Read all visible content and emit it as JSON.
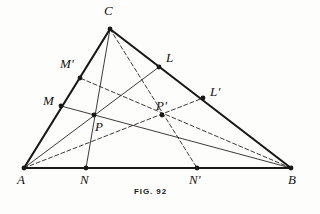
{
  "figure": {
    "caption": "FIG. 92",
    "ink_color": "#1a1815",
    "paper_color": "#fdfdfc",
    "points": [
      {
        "id": "A",
        "label": "A",
        "x": 24,
        "y": 168,
        "label_x": 17,
        "label_y": 173,
        "dot": true
      },
      {
        "id": "B",
        "label": "B",
        "x": 291,
        "y": 168,
        "label_x": 288,
        "label_y": 173,
        "dot": true
      },
      {
        "id": "C",
        "label": "C",
        "x": 110,
        "y": 29,
        "label_x": 104,
        "label_y": 4,
        "dot": true
      },
      {
        "id": "N",
        "label": "N",
        "x": 86,
        "y": 168,
        "label_x": 80,
        "label_y": 173,
        "dot": true
      },
      {
        "id": "Np",
        "label": "N'",
        "x": 197,
        "y": 168,
        "label_x": 189,
        "label_y": 173,
        "dot": true
      },
      {
        "id": "M",
        "label": "M",
        "x": 61,
        "y": 106,
        "label_x": 43,
        "label_y": 94,
        "dot": true
      },
      {
        "id": "Mp",
        "label": "M'",
        "x": 80,
        "y": 78,
        "label_x": 60,
        "label_y": 57,
        "dot": true
      },
      {
        "id": "L",
        "label": "L",
        "x": 159,
        "y": 67,
        "label_x": 166,
        "label_y": 51,
        "dot": true
      },
      {
        "id": "Lp",
        "label": "L'",
        "x": 203,
        "y": 98,
        "label_x": 210,
        "label_y": 85,
        "dot": true
      },
      {
        "id": "P",
        "label": "P",
        "x": 94,
        "y": 115,
        "label_x": 95,
        "label_y": 120,
        "dot": true
      },
      {
        "id": "Pp",
        "label": "P'",
        "x": 162,
        "y": 115,
        "label_x": 156,
        "label_y": 99,
        "dot": true
      }
    ],
    "sides": [
      {
        "name": "side-AB",
        "from": "A",
        "to": "B",
        "style": "solid",
        "weight": 2.1
      },
      {
        "name": "side-AC",
        "from": "A",
        "to": "C",
        "style": "solid",
        "weight": 2.1
      },
      {
        "name": "side-BC",
        "from": "C",
        "to": "B",
        "style": "solid",
        "weight": 2.1
      }
    ],
    "cevians": [
      {
        "name": "cevian-AL",
        "from": "A",
        "to": "L",
        "style": "solid",
        "weight": 0.85
      },
      {
        "name": "cevian-BM",
        "from": "B",
        "to": "M",
        "style": "solid",
        "weight": 0.85
      },
      {
        "name": "cevian-CN",
        "from": "C",
        "to": "N",
        "style": "solid",
        "weight": 0.85
      },
      {
        "name": "cevian-ALp",
        "from": "A",
        "to": "Lp",
        "style": "dashed",
        "weight": 0.85
      },
      {
        "name": "cevian-BMp",
        "from": "B",
        "to": "Mp",
        "style": "dashed",
        "weight": 0.85
      },
      {
        "name": "cevian-CNp",
        "from": "C",
        "to": "Np",
        "style": "dashed",
        "weight": 0.85
      }
    ],
    "dot_radius": 2.4,
    "dash_pattern": "4 2.6"
  }
}
